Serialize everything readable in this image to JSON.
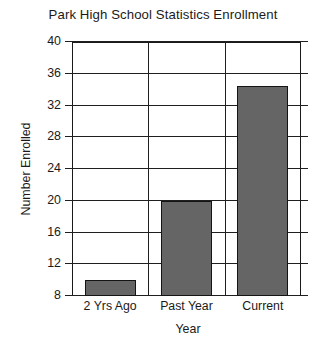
{
  "chart_data": {
    "type": "bar",
    "title": "Park High School Statistics Enrollment",
    "xlabel": "Year",
    "ylabel": "Number Enrolled",
    "categories": [
      "2 Yrs Ago",
      "Past Year",
      "Current"
    ],
    "values": [
      10,
      20,
      34.5
    ],
    "ylim": [
      8,
      40
    ],
    "ytick_step": 4,
    "yticks": [
      "8",
      "12",
      "16",
      "20",
      "24",
      "28",
      "32",
      "36",
      "40"
    ],
    "grid": true,
    "legend": false,
    "bar_color": "#656565",
    "bar_edge_color": "#141414",
    "axis_color": "#1a1a1a",
    "background": "#ffffff"
  }
}
